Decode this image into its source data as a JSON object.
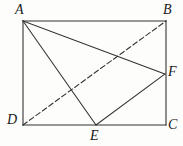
{
  "figure": {
    "kind": "plane-geometry-diagram",
    "background_color": "#fdfdfc",
    "stroke_color": "#333333",
    "label_color": "#1b1b1b",
    "stroke_width": 1.1,
    "dash_pattern": "5,3",
    "canvas": {
      "width": 183,
      "height": 146
    },
    "points": {
      "A": {
        "label": "A",
        "x": 23,
        "y": 21
      },
      "B": {
        "label": "B",
        "x": 166,
        "y": 21
      },
      "C": {
        "label": "C",
        "x": 166,
        "y": 125
      },
      "D": {
        "label": "D",
        "x": 23,
        "y": 125
      },
      "E": {
        "label": "E",
        "x": 96,
        "y": 125
      },
      "F": {
        "label": "F",
        "x": 165,
        "y": 74
      }
    },
    "segments": [
      {
        "name": "side-AB",
        "from": "A",
        "to": "B",
        "style": "solid"
      },
      {
        "name": "side-BC",
        "from": "B",
        "to": "C",
        "style": "solid"
      },
      {
        "name": "side-CD",
        "from": "C",
        "to": "D",
        "style": "solid"
      },
      {
        "name": "side-DA",
        "from": "D",
        "to": "A",
        "style": "solid"
      },
      {
        "name": "segment-AF",
        "from": "A",
        "to": "F",
        "style": "solid"
      },
      {
        "name": "segment-AE",
        "from": "A",
        "to": "E",
        "style": "solid"
      },
      {
        "name": "segment-EF",
        "from": "E",
        "to": "F",
        "style": "solid"
      },
      {
        "name": "diagonal-DB",
        "from": "D",
        "to": "B",
        "style": "dashed"
      }
    ]
  }
}
